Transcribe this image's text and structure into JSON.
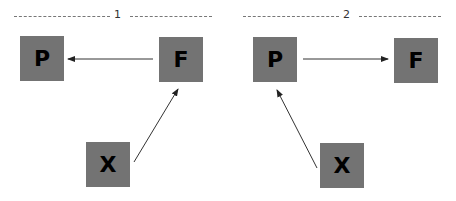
{
  "panels": [
    {
      "label": "1",
      "nodes": {
        "p": "P",
        "f": "F",
        "x": "X"
      },
      "edges": [
        {
          "from": "F",
          "to": "P"
        },
        {
          "from": "X",
          "to": "F"
        }
      ]
    },
    {
      "label": "2",
      "nodes": {
        "p": "P",
        "f": "F",
        "x": "X"
      },
      "edges": [
        {
          "from": "P",
          "to": "F"
        },
        {
          "from": "X",
          "to": "P"
        }
      ]
    }
  ],
  "colors": {
    "box": "#737373",
    "text": "#000000",
    "line": "#333333"
  }
}
